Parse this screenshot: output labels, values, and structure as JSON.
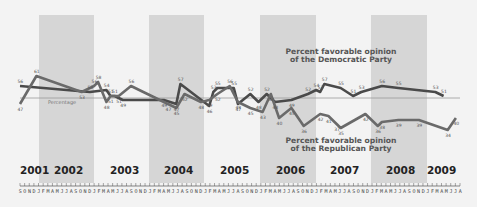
{
  "chart_data": {
    "type": "line",
    "title": "",
    "xlabel": "",
    "ylabel": "",
    "reference_line": {
      "value": 50,
      "label": "Percentage"
    },
    "x_start": "2001-09",
    "x_end": "2009-08",
    "year_labels": [
      "2001",
      "2002",
      "2003",
      "2004",
      "2005",
      "2006",
      "2007",
      "2008",
      "2009"
    ],
    "month_tick_labels": [
      "S",
      "O",
      "N",
      "D",
      "J",
      "F",
      "M",
      "A",
      "M",
      "J",
      "J",
      "A",
      "S",
      "O",
      "N",
      "D",
      "J",
      "F",
      "M",
      "A",
      "M",
      "J",
      "J",
      "A",
      "S",
      "O",
      "N",
      "D",
      "J",
      "F",
      "M",
      "A",
      "M",
      "J",
      "J",
      "A",
      "S",
      "O",
      "N",
      "D",
      "J",
      "F",
      "M",
      "A",
      "M",
      "J",
      "J",
      "A",
      "S",
      "O",
      "N",
      "D",
      "J",
      "F",
      "M",
      "A",
      "M",
      "J",
      "J",
      "A",
      "S",
      "O",
      "N",
      "D",
      "J",
      "F",
      "M",
      "A",
      "M",
      "J",
      "J",
      "A",
      "S",
      "O",
      "N",
      "D",
      "J",
      "F",
      "M",
      "A",
      "M",
      "J",
      "J",
      "A",
      "S",
      "O",
      "N",
      "D",
      "J",
      "F",
      "M",
      "A",
      "M",
      "J",
      "J",
      "A"
    ],
    "shaded_years": [
      "2002",
      "2004",
      "2006",
      "2008"
    ],
    "series": [
      {
        "name": "Percent favorable opinion of the Democratic Party",
        "label_lines": [
          "Percent favorable opinion",
          "of the Democratic Party"
        ],
        "color": "#555555",
        "points": [
          {
            "m": 0,
            "v": 56
          },
          {
            "m": 17,
            "v": 53
          },
          {
            "m": 21,
            "v": 54
          },
          {
            "m": 22,
            "v": 51
          },
          {
            "m": 23,
            "v": 51
          },
          {
            "m": 25,
            "v": 49
          },
          {
            "m": 35,
            "v": 49
          },
          {
            "m": 38,
            "v": 47
          },
          {
            "m": 39,
            "v": 57
          },
          {
            "m": 46,
            "v": 46
          },
          {
            "m": 47,
            "v": 53
          },
          {
            "m": 48,
            "v": 55
          },
          {
            "m": 52,
            "v": 55
          },
          {
            "m": 53,
            "v": 47
          },
          {
            "m": 56,
            "v": 52
          },
          {
            "m": 58,
            "v": 48
          },
          {
            "m": 60,
            "v": 52
          },
          {
            "m": 62,
            "v": 48
          },
          {
            "m": 66,
            "v": 49
          },
          {
            "m": 70,
            "v": 52
          },
          {
            "m": 72,
            "v": 54
          },
          {
            "m": 73,
            "v": 53
          },
          {
            "m": 74,
            "v": 57
          },
          {
            "m": 78,
            "v": 55
          },
          {
            "m": 81,
            "v": 51
          },
          {
            "m": 83,
            "v": 53
          },
          {
            "m": 88,
            "v": 56
          },
          {
            "m": 92,
            "v": 55
          },
          {
            "m": 101,
            "v": 53
          },
          {
            "m": 103,
            "v": 51
          }
        ]
      },
      {
        "name": "Percent favorable opinion of the Republican Party",
        "label_lines": [
          "Percent favorable opinion",
          "of the Republican Party"
        ],
        "color": "#666666",
        "points": [
          {
            "m": 0,
            "v": 47
          },
          {
            "m": 4,
            "v": 61
          },
          {
            "m": 15,
            "v": 53
          },
          {
            "m": 18,
            "v": 56
          },
          {
            "m": 19,
            "v": 58
          },
          {
            "m": 21,
            "v": 48
          },
          {
            "m": 22,
            "v": 51
          },
          {
            "m": 24,
            "v": 51
          },
          {
            "m": 27,
            "v": 56
          },
          {
            "m": 36,
            "v": 47
          },
          {
            "m": 38,
            "v": 45
          },
          {
            "m": 40,
            "v": 52
          },
          {
            "m": 44,
            "v": 48
          },
          {
            "m": 46,
            "v": 49
          },
          {
            "m": 48,
            "v": 52
          },
          {
            "m": 51,
            "v": 56
          },
          {
            "m": 53,
            "v": 48
          },
          {
            "m": 56,
            "v": 45
          },
          {
            "m": 59,
            "v": 43
          },
          {
            "m": 61,
            "v": 52
          },
          {
            "m": 63,
            "v": 40
          },
          {
            "m": 66,
            "v": 45
          },
          {
            "m": 69,
            "v": 36
          },
          {
            "m": 73,
            "v": 42
          },
          {
            "m": 75,
            "v": 41
          },
          {
            "m": 77,
            "v": 37
          },
          {
            "m": 78,
            "v": 35
          },
          {
            "m": 84,
            "v": 42
          },
          {
            "m": 87,
            "v": 36
          },
          {
            "m": 88,
            "v": 38
          },
          {
            "m": 92,
            "v": 39
          },
          {
            "m": 97,
            "v": 39
          },
          {
            "m": 104,
            "v": 34
          },
          {
            "m": 106,
            "v": 40
          }
        ]
      }
    ],
    "ylim": [
      30,
      70
    ],
    "grid": false,
    "legend": "inline labels near lines"
  }
}
